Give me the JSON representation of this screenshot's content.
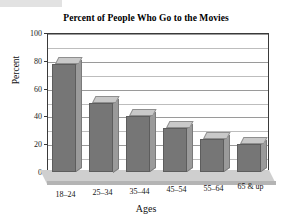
{
  "chart_data": {
    "type": "bar",
    "title": "Percent of People Who Go to the Movies",
    "xlabel": "Ages",
    "ylabel": "Percent",
    "categories": [
      "18–24",
      "25–34",
      "35–44",
      "45–54",
      "55–64",
      "65 & up"
    ],
    "values": [
      78,
      50,
      40,
      32,
      24,
      20
    ],
    "ylim": [
      0,
      100
    ],
    "ytick_labels": [
      "0",
      "20",
      "40",
      "60",
      "80",
      "100"
    ],
    "ytick_values": [
      0,
      20,
      40,
      60,
      80,
      100
    ],
    "gridline_values": [
      10,
      20,
      30,
      40,
      50,
      60,
      70,
      80,
      90,
      100
    ],
    "grid": true,
    "legend": "none",
    "style": "3d-column",
    "colors": {
      "bar_front": "#767676",
      "bar_top": "#c9c9c9",
      "bar_side": "#9a9a9a",
      "floor": "#cfcfcf",
      "gridline": "#bdbdbd",
      "axis": "#3a3a3a",
      "text": "#111111",
      "background": "#ffffff"
    }
  }
}
